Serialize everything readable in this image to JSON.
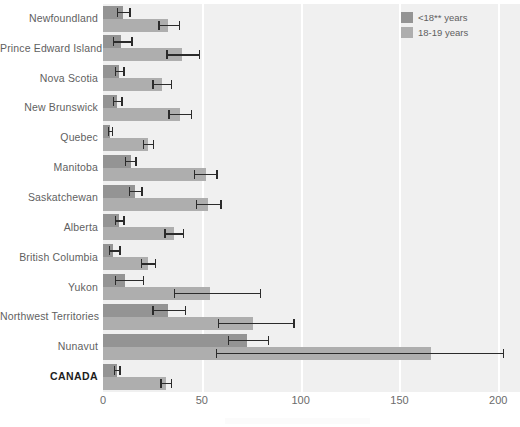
{
  "chart_data": {
    "type": "bar",
    "orientation": "horizontal",
    "title": "",
    "subtitle": "",
    "xlabel": "",
    "ylabel": "",
    "xlim": [
      0,
      211
    ],
    "xticks": [
      0,
      50,
      100,
      150,
      200
    ],
    "xtick_labels": [
      "0",
      "50",
      "100",
      "150",
      "200"
    ],
    "grid": "vertical-white-gridlines",
    "legend_position": "top-right",
    "categories": [
      "Newfoundland",
      "Prince Edward Island",
      "Nova Scotia",
      "New Brunswick",
      "Quebec",
      "Manitoba",
      "Saskatchewan",
      "Alberta",
      "British Columbia",
      "Yukon",
      "Northwest Territories",
      "Nunavut",
      "CANADA"
    ],
    "highlight_category": "CANADA",
    "series": [
      {
        "name": "<18** years",
        "color": "#949494",
        "values": [
          10,
          9,
          8,
          7,
          3.5,
          14,
          16,
          8,
          5,
          11,
          33,
          73,
          7
        ],
        "error_low": [
          7,
          5,
          6,
          5,
          2.5,
          11,
          13,
          6,
          3,
          6,
          25,
          63,
          5.5
        ],
        "error_high": [
          14,
          15,
          11,
          10,
          5,
          17,
          20,
          11,
          9,
          21,
          42,
          84,
          9
        ]
      },
      {
        "name": "18-19 years",
        "color": "#aeaeae",
        "values": [
          33,
          40,
          30,
          39,
          23,
          52,
          53,
          36,
          23,
          54,
          76,
          166,
          32
        ],
        "error_low": [
          28,
          32,
          25,
          33,
          20,
          46,
          47,
          31,
          19,
          36,
          58,
          57,
          29
        ],
        "error_high": [
          39,
          49,
          35,
          45,
          26,
          58,
          60,
          41,
          27,
          80,
          97,
          203,
          35
        ]
      }
    ]
  },
  "legend": {
    "items": [
      {
        "label": "<18** years",
        "swatch_class": "under18"
      },
      {
        "label": "18-19 years",
        "swatch_class": "age1819"
      }
    ]
  },
  "colors": {
    "plot_background": "#f0f0f0",
    "gridline": "#ffffff",
    "series_under18": "#949494",
    "series_1819": "#aeaeae",
    "error_bar": "#2b2b2b",
    "label_text": "#5f5f5f",
    "highlight_text": "#1d1d1d"
  }
}
